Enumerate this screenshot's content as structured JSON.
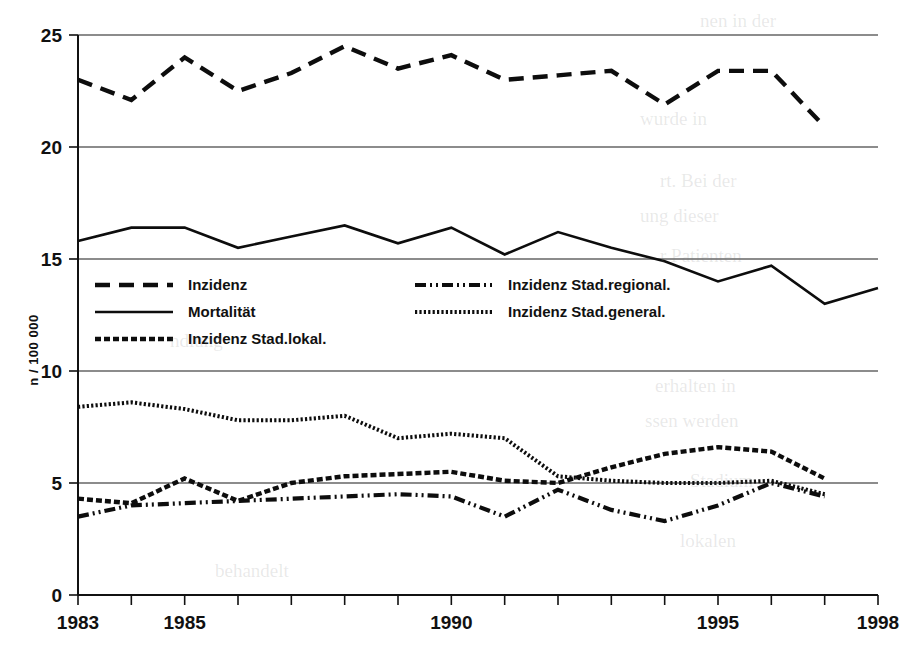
{
  "figure": {
    "background_color": "#ffffff",
    "ink_color": "#0d0d0d"
  },
  "chart_data": {
    "type": "line",
    "title": "",
    "subtitle": "",
    "xlabel": "",
    "ylabel": "n / 100 000",
    "xlim": [
      1983,
      1998
    ],
    "ylim": [
      0,
      25
    ],
    "grid": true,
    "legend_position": "inside-upper-left",
    "x": [
      1983,
      1984,
      1985,
      1986,
      1987,
      1988,
      1989,
      1990,
      1991,
      1992,
      1993,
      1994,
      1995,
      1996,
      1997,
      1998
    ],
    "xticks": [
      1983,
      1984,
      1985,
      1986,
      1987,
      1988,
      1989,
      1990,
      1991,
      1992,
      1993,
      1994,
      1995,
      1996,
      1997,
      1998
    ],
    "xtick_labels": [
      "1983",
      "",
      "1985",
      "",
      "",
      "",
      "",
      "1990",
      "",
      "",
      "",
      "",
      "1995",
      "",
      "",
      "1998"
    ],
    "yticks": [
      0,
      5,
      10,
      15,
      20,
      25
    ],
    "ytick_labels": [
      "0",
      "5",
      "10",
      "15",
      "20",
      "25"
    ],
    "series": [
      {
        "name": "Inzidenz",
        "style": "dashed",
        "x": [
          1983,
          1984,
          1985,
          1986,
          1987,
          1988,
          1989,
          1990,
          1991,
          1992,
          1993,
          1994,
          1995,
          1996,
          1997
        ],
        "values": [
          23.0,
          22.1,
          24.0,
          22.5,
          23.3,
          24.5,
          23.5,
          24.1,
          23.0,
          23.2,
          23.4,
          21.9,
          23.4,
          23.4,
          20.9
        ]
      },
      {
        "name": "Mortalität",
        "style": "solid",
        "x": [
          1983,
          1984,
          1985,
          1986,
          1987,
          1988,
          1989,
          1990,
          1991,
          1992,
          1993,
          1994,
          1995,
          1996,
          1997,
          1998
        ],
        "values": [
          15.8,
          16.4,
          16.4,
          15.5,
          16.0,
          16.5,
          15.7,
          16.4,
          15.2,
          16.2,
          15.5,
          14.9,
          14.0,
          14.7,
          13.0,
          13.7
        ]
      },
      {
        "name": "Inzidenz Stad.lokal.",
        "style": "dotted-dense",
        "x": [
          1983,
          1984,
          1985,
          1986,
          1987,
          1988,
          1989,
          1990,
          1991,
          1992,
          1993,
          1994,
          1995,
          1996,
          1997
        ],
        "values": [
          4.3,
          4.1,
          5.2,
          4.2,
          5.0,
          5.3,
          5.4,
          5.5,
          5.1,
          5.0,
          5.7,
          6.3,
          6.6,
          6.4,
          5.2
        ]
      },
      {
        "name": "Inzidenz Stad.regional.",
        "style": "dash-dot-dot",
        "x": [
          1983,
          1984,
          1985,
          1986,
          1987,
          1988,
          1989,
          1990,
          1991,
          1992,
          1993,
          1994,
          1995,
          1996,
          1997
        ],
        "values": [
          3.5,
          4.0,
          4.1,
          4.2,
          4.3,
          4.4,
          4.5,
          4.4,
          3.5,
          4.7,
          3.8,
          3.3,
          4.0,
          5.0,
          4.4
        ]
      },
      {
        "name": "Inzidenz Stad.general.",
        "style": "dotted-fine",
        "x": [
          1983,
          1984,
          1985,
          1986,
          1987,
          1988,
          1989,
          1990,
          1991,
          1992,
          1993,
          1994,
          1995,
          1996,
          1997
        ],
        "values": [
          8.4,
          8.6,
          8.3,
          7.8,
          7.8,
          8.0,
          7.0,
          7.2,
          7.0,
          5.3,
          5.1,
          5.0,
          5.0,
          5.1,
          4.5
        ]
      }
    ]
  },
  "legend": {
    "entries": [
      {
        "label": "Inzidenz",
        "style": "dashed"
      },
      {
        "label": "Mortalität",
        "style": "solid"
      },
      {
        "label": "Inzidenz Stad.lokal.",
        "style": "dotted-dense"
      },
      {
        "label": "Inzidenz Stad.regional.",
        "style": "dash-dot-dot"
      },
      {
        "label": "Inzidenz Stad.general.",
        "style": "dotted-fine"
      }
    ]
  },
  "axes": {
    "y_title": "n / 100 000",
    "y_tick_labels": [
      "0",
      "5",
      "10",
      "15",
      "20",
      "25"
    ],
    "x_tick_labels": [
      "1983",
      "1985",
      "1990",
      "1995",
      "1998"
    ]
  }
}
